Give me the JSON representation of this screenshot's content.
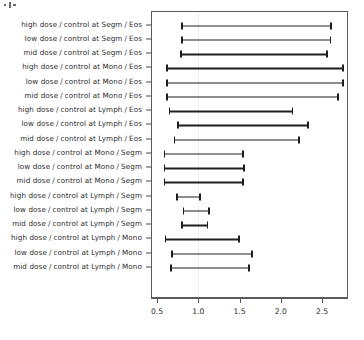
{
  "chart_data": {
    "type": "bar",
    "subtype": "horizontal-confidence-interval-forest-plot",
    "title": "",
    "xlabel": "",
    "ylabel": "",
    "grid": false,
    "legend": "none",
    "xlim": [
      0.45,
      2.85
    ],
    "xticks": [
      "0.5",
      "1.0",
      "1.5",
      "2.0",
      "2.5"
    ],
    "xtick_values": [
      0.5,
      1.0,
      1.5,
      2.0,
      2.5
    ],
    "reference_line": 1.0,
    "categories": [
      "high dose / control at Segm / Eos",
      "low dose / control at Segm / Eos",
      "mid dose / control at Segm / Eos",
      "high dose / control at Mono / Eos",
      "low dose / control at Mono / Eos",
      "mid dose / control at Mono / Eos",
      "high dose / control at Lymph / Eos",
      "low dose / control at Lymph / Eos",
      "mid dose / control at Lymph / Eos",
      "high dose / control at Mono / Segm",
      "low dose / control at Mono / Segm",
      "mid dose / control at Mono / Segm",
      "high dose / control at Lymph / Segm",
      "low dose / control at Lymph / Segm",
      "mid dose / control at Lymph / Segm",
      "high dose / control at Lymph / Mono",
      "low dose / control at Lymph / Mono",
      "mid dose / control at Lymph / Mono"
    ],
    "lower": [
      0.78,
      0.78,
      0.77,
      0.6,
      0.6,
      0.6,
      0.63,
      0.73,
      0.69,
      0.57,
      0.57,
      0.57,
      0.72,
      0.8,
      0.78,
      0.58,
      0.66,
      0.65
    ],
    "upper": [
      2.61,
      2.6,
      2.56,
      2.75,
      2.75,
      2.69,
      2.14,
      2.33,
      2.22,
      1.54,
      1.55,
      1.54,
      1.02,
      1.13,
      1.11,
      1.49,
      1.65,
      1.61
    ]
  },
  "rows": [
    {
      "dose": "high dose",
      "sep1": "/",
      "contrast": "control at Segm",
      "sep2": "/",
      "outcome": "Eos",
      "lower": 0.78,
      "upper": 2.61
    },
    {
      "dose": "low dose",
      "sep1": "/",
      "contrast": "control at Segm",
      "sep2": "/",
      "outcome": "Eos",
      "lower": 0.78,
      "upper": 2.6
    },
    {
      "dose": "mid dose",
      "sep1": "/",
      "contrast": "control at Segm",
      "sep2": "/",
      "outcome": "Eos",
      "lower": 0.77,
      "upper": 2.56
    },
    {
      "dose": "high dose",
      "sep1": "/",
      "contrast": "control at Mono",
      "sep2": "/",
      "outcome": "Eos",
      "lower": 0.6,
      "upper": 2.75
    },
    {
      "dose": "low dose",
      "sep1": "/",
      "contrast": "control at Mono",
      "sep2": "/",
      "outcome": "Eos",
      "lower": 0.6,
      "upper": 2.75
    },
    {
      "dose": "mid dose",
      "sep1": "/",
      "contrast": "control at Mono",
      "sep2": "/",
      "outcome": "Eos",
      "lower": 0.6,
      "upper": 2.69
    },
    {
      "dose": "high dose",
      "sep1": "/",
      "contrast": "control at Lymph",
      "sep2": "/",
      "outcome": "Eos",
      "lower": 0.63,
      "upper": 2.14
    },
    {
      "dose": "low dose",
      "sep1": "/",
      "contrast": "control at Lymph",
      "sep2": "/",
      "outcome": "Eos",
      "lower": 0.73,
      "upper": 2.33
    },
    {
      "dose": "mid dose",
      "sep1": "/",
      "contrast": "control at Lymph",
      "sep2": "/",
      "outcome": "Eos",
      "lower": 0.69,
      "upper": 2.22
    },
    {
      "dose": "high dose",
      "sep1": "/",
      "contrast": "control at Mono",
      "sep2": "/",
      "outcome": "Segm",
      "lower": 0.57,
      "upper": 1.54
    },
    {
      "dose": "low dose",
      "sep1": "/",
      "contrast": "control at Mono",
      "sep2": "/",
      "outcome": "Segm",
      "lower": 0.57,
      "upper": 1.55
    },
    {
      "dose": "mid dose",
      "sep1": "/",
      "contrast": "control at Mono",
      "sep2": "/",
      "outcome": "Segm",
      "lower": 0.57,
      "upper": 1.54
    },
    {
      "dose": "high dose",
      "sep1": "/",
      "contrast": "control at Lymph",
      "sep2": "/",
      "outcome": "Segm",
      "lower": 0.72,
      "upper": 1.02
    },
    {
      "dose": "low dose",
      "sep1": "/",
      "contrast": "control at Lymph",
      "sep2": "/",
      "outcome": "Segm",
      "lower": 0.8,
      "upper": 1.13
    },
    {
      "dose": "mid dose",
      "sep1": "/",
      "contrast": "control at Lymph",
      "sep2": "/",
      "outcome": "Segm",
      "lower": 0.78,
      "upper": 1.11
    },
    {
      "dose": "high dose",
      "sep1": "/",
      "contrast": "control at Lymph",
      "sep2": "/",
      "outcome": "Mono",
      "lower": 0.58,
      "upper": 1.49
    },
    {
      "dose": "low dose",
      "sep1": "/",
      "contrast": "control at Lymph",
      "sep2": "/",
      "outcome": "Mono",
      "lower": 0.66,
      "upper": 1.65
    },
    {
      "dose": "mid dose",
      "sep1": "/",
      "contrast": "control at Lymph",
      "sep2": "/",
      "outcome": "Mono",
      "lower": 0.65,
      "upper": 1.61
    }
  ],
  "colors": {
    "interval": "#1f1f1f",
    "axis": "#5a5a5a",
    "text": "#2b2b2b",
    "grid": "#efefef",
    "background": "#ffffff"
  }
}
